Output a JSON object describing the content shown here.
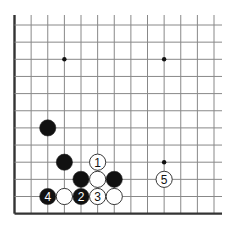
{
  "diagram": {
    "type": "go-board-corner",
    "grid": {
      "columns": 13,
      "rows": 12,
      "origin_x": 14.5,
      "origin_y": 25,
      "spacing_x": 16.625,
      "spacing_y": 17.15,
      "left_edge": true,
      "bottom_edge": true,
      "line_color": "#888888",
      "edge_color": "#333333"
    },
    "star_points": [
      {
        "col": 3,
        "row": 2
      },
      {
        "col": 9,
        "row": 2
      },
      {
        "col": 9,
        "row": 8
      }
    ],
    "stones": [
      {
        "color": "black",
        "col": 2,
        "row": 6,
        "label": ""
      },
      {
        "color": "black",
        "col": 3,
        "row": 8,
        "label": ""
      },
      {
        "color": "white",
        "col": 5,
        "row": 8,
        "label": "1"
      },
      {
        "color": "black",
        "col": 4,
        "row": 9,
        "label": ""
      },
      {
        "color": "white",
        "col": 5,
        "row": 9,
        "label": ""
      },
      {
        "color": "black",
        "col": 6,
        "row": 9,
        "label": ""
      },
      {
        "color": "white",
        "col": 9,
        "row": 9,
        "label": "5"
      },
      {
        "color": "black",
        "col": 2,
        "row": 10,
        "label": "4"
      },
      {
        "color": "white",
        "col": 3,
        "row": 10,
        "label": ""
      },
      {
        "color": "black",
        "col": 4,
        "row": 10,
        "label": "2"
      },
      {
        "color": "white",
        "col": 5,
        "row": 10,
        "label": "3"
      },
      {
        "color": "white",
        "col": 6,
        "row": 10,
        "label": ""
      }
    ]
  }
}
